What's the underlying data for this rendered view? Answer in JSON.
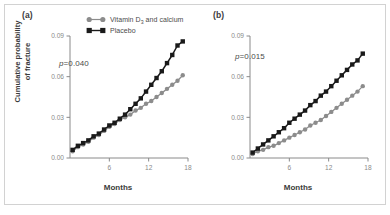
{
  "figure": {
    "border_color": "#d2d2d2",
    "background": "#ffffff"
  },
  "axis": {
    "ylabel_line1": "Cumulative probability",
    "ylabel_line2": "of fracture",
    "xlabel": "Months",
    "yticks": [
      "0.00",
      "0.03",
      "0.06",
      "0.09"
    ],
    "xticks": [
      "6",
      "12",
      "18"
    ]
  },
  "legend": {
    "items": [
      {
        "label_prefix": "Vitamin D",
        "label_sub": "3",
        "label_suffix": " and calcium",
        "marker": "circle",
        "color": "#8c8c8c"
      },
      {
        "label_prefix": "Placebo",
        "label_sub": "",
        "label_suffix": "",
        "marker": "square",
        "color": "#1a1a1a"
      }
    ]
  },
  "panels": [
    {
      "tag": "(a)",
      "pvalue_label": "p",
      "pvalue_text": "=0.040"
    },
    {
      "tag": "(b)",
      "pvalue_label": "p",
      "pvalue_text": "=0.015"
    }
  ],
  "chart_data": {
    "type": "line",
    "title": "",
    "xlabel": "Months",
    "ylabel": "Cumulative probability of fracture",
    "xlim": [
      0,
      18
    ],
    "ylim": [
      0.0,
      0.09
    ],
    "yticks": [
      0.0,
      0.03,
      0.06,
      0.09
    ],
    "xticks": [
      6,
      12,
      18
    ],
    "grid": false,
    "legend_position": "top-center-panel-a",
    "panels": [
      {
        "tag": "(a)",
        "annotation": "p=0.040",
        "series": [
          {
            "name": "Placebo",
            "color": "#1a1a1a",
            "marker": "square",
            "x": [
              0.4,
              1.2,
              2.0,
              2.8,
              3.6,
              4.4,
              5.2,
              6.0,
              6.8,
              7.6,
              8.4,
              9.2,
              10.0,
              10.8,
              11.6,
              12.4,
              13.2,
              14.0,
              14.8,
              15.6,
              16.4,
              17.2
            ],
            "y": [
              0.006,
              0.009,
              0.011,
              0.013,
              0.016,
              0.018,
              0.021,
              0.024,
              0.026,
              0.029,
              0.032,
              0.036,
              0.04,
              0.044,
              0.049,
              0.054,
              0.059,
              0.064,
              0.07,
              0.076,
              0.083,
              0.086
            ]
          },
          {
            "name": "Vitamin D3 and calcium",
            "color": "#8c8c8c",
            "marker": "circle",
            "x": [
              0.4,
              1.2,
              2.0,
              2.8,
              3.6,
              4.4,
              5.2,
              6.0,
              6.8,
              7.6,
              8.4,
              9.2,
              10.0,
              10.8,
              11.6,
              12.4,
              13.2,
              14.0,
              14.8,
              15.6,
              16.4,
              17.2
            ],
            "y": [
              0.005,
              0.008,
              0.01,
              0.012,
              0.015,
              0.017,
              0.02,
              0.023,
              0.025,
              0.028,
              0.03,
              0.032,
              0.035,
              0.037,
              0.04,
              0.042,
              0.045,
              0.048,
              0.051,
              0.054,
              0.057,
              0.061
            ]
          }
        ]
      },
      {
        "tag": "(b)",
        "annotation": "p=0.015",
        "series": [
          {
            "name": "Placebo",
            "color": "#1a1a1a",
            "marker": "square",
            "x": [
              0.4,
              1.2,
              2.0,
              2.8,
              3.6,
              4.4,
              5.2,
              6.0,
              6.8,
              7.6,
              8.4,
              9.2,
              10.0,
              10.8,
              11.6,
              12.4,
              13.2,
              14.0,
              14.8,
              15.6,
              16.4,
              17.2
            ],
            "y": [
              0.004,
              0.007,
              0.01,
              0.013,
              0.016,
              0.019,
              0.022,
              0.026,
              0.029,
              0.032,
              0.035,
              0.039,
              0.042,
              0.046,
              0.049,
              0.053,
              0.057,
              0.061,
              0.065,
              0.069,
              0.072,
              0.077
            ]
          },
          {
            "name": "Vitamin D3 and calcium",
            "color": "#8c8c8c",
            "marker": "circle",
            "x": [
              0.4,
              1.2,
              2.0,
              2.8,
              3.6,
              4.4,
              5.2,
              6.0,
              6.8,
              7.6,
              8.4,
              9.2,
              10.0,
              10.8,
              11.6,
              12.4,
              13.2,
              14.0,
              14.8,
              15.6,
              16.4,
              17.2
            ],
            "y": [
              0.003,
              0.005,
              0.006,
              0.008,
              0.009,
              0.011,
              0.013,
              0.015,
              0.017,
              0.019,
              0.021,
              0.024,
              0.026,
              0.028,
              0.031,
              0.034,
              0.037,
              0.04,
              0.043,
              0.046,
              0.049,
              0.053
            ]
          }
        ]
      }
    ]
  }
}
